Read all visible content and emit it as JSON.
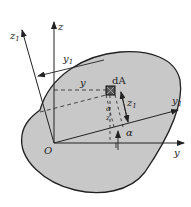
{
  "figure": {
    "type": "cross-section rotation of axes diagram",
    "labels": {
      "origin": "O",
      "y_axis": "y",
      "z_axis": "z",
      "y1_axis": "y",
      "y1_sub": "1",
      "z1_axis": "z",
      "z1_sub": "1",
      "area_element": "dA",
      "angle": "α",
      "dim_y": "y",
      "dim_y1": "y",
      "dim_y1_sub": "1",
      "dim_z1": "z",
      "dim_z1_sub": "1",
      "small_alpha": "α",
      "small_alpha_sub": "1",
      "small_z": "z",
      "small_z_sub": "1"
    },
    "colors": {
      "shape_fill": "#c8c8c8",
      "stroke": "#222222",
      "background": "#ffffff"
    }
  }
}
